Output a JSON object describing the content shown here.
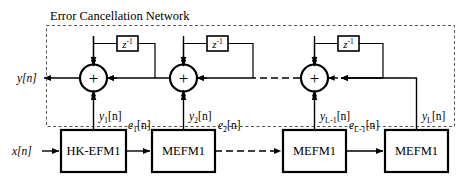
{
  "diagram": {
    "title": "Error Cancellation Network",
    "input_label": "x[n]",
    "output_label": "y[n]",
    "boundary_style": "dashed",
    "delay_label_base": "z",
    "delay_label_exp": "-1",
    "sum_symbol": "+",
    "blocks": [
      {
        "id": "blk1",
        "label": "HK-EFM1"
      },
      {
        "id": "blk2",
        "label": "MEFM1"
      },
      {
        "id": "blk3",
        "label": "MEFM1"
      },
      {
        "id": "blk4",
        "label": "MEFM1"
      }
    ],
    "error_labels": [
      {
        "base": "e",
        "sub": "1",
        "tail": "[n]"
      },
      {
        "base": "e",
        "sub": "2",
        "tail": "[n]"
      },
      {
        "base": "e",
        "sub": "L-1",
        "tail": "[n]"
      }
    ],
    "stage_outputs": [
      {
        "base": "y",
        "sub": "1",
        "tail": "[n]"
      },
      {
        "base": "y",
        "sub": "2",
        "tail": "[n]"
      },
      {
        "base": "y",
        "sub": "L-1",
        "tail": "[n]"
      },
      {
        "base": "y",
        "sub": "L",
        "tail": "[n]"
      }
    ],
    "delays": [
      {
        "id": "z1"
      },
      {
        "id": "z2"
      },
      {
        "id": "z3"
      }
    ],
    "summers": [
      {
        "id": "sum1"
      },
      {
        "id": "sum2"
      },
      {
        "id": "sum3"
      }
    ],
    "colors": {
      "stroke": "#000000",
      "background": "#ffffff",
      "boundary": "#555555"
    }
  }
}
